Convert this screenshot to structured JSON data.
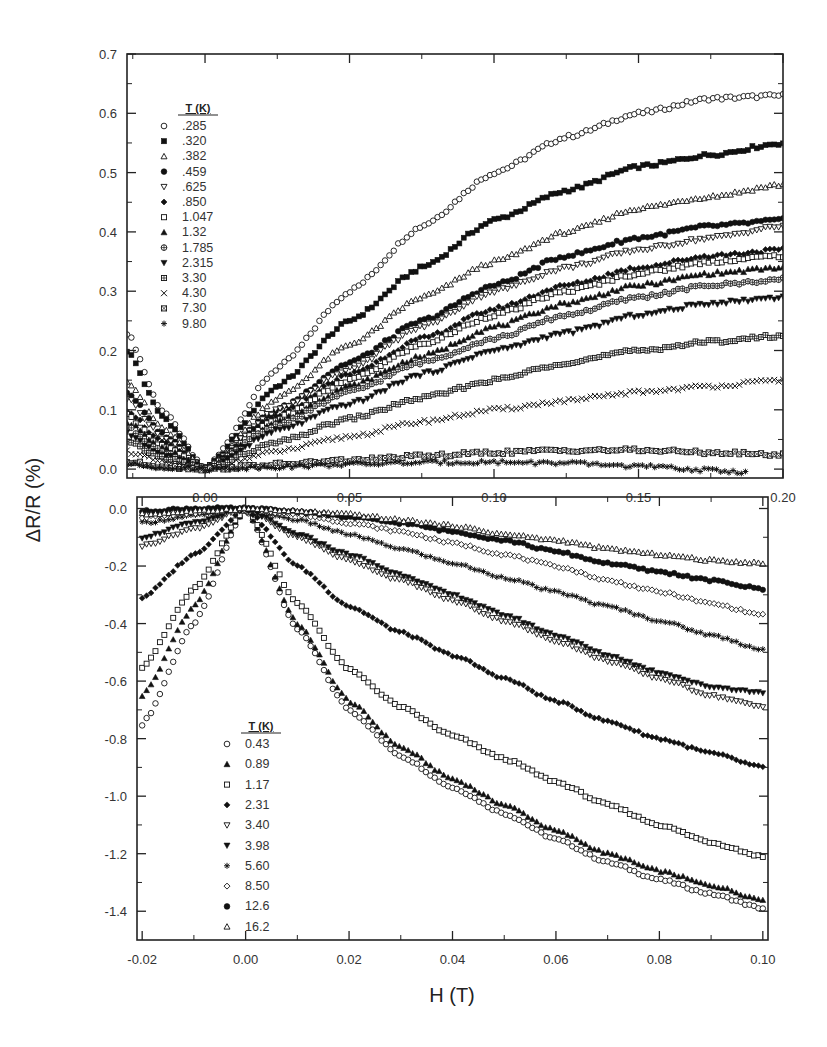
{
  "figure": {
    "ylabel": "ΔR/R (%)",
    "xlabel": "H (T)"
  },
  "chart_data": [
    {
      "type": "scatter",
      "panel": "top",
      "title": "",
      "xlabel": "",
      "ylabel": "ΔR/R (%)",
      "xlim": [
        -0.027,
        0.2
      ],
      "ylim": [
        -0.015,
        0.7
      ],
      "x_ticks": [
        "0.00",
        "0.05",
        "0.10",
        "0.15",
        "0.20"
      ],
      "y_ticks": [
        "0.0",
        "0.1",
        "0.2",
        "0.3",
        "0.4",
        "0.5",
        "0.6",
        "0.7"
      ],
      "grid": false,
      "legend_title": "T (K)",
      "legend_position": "upper-left",
      "series": [
        {
          "name": ".285",
          "marker": "open-circle",
          "x": [
            -0.027,
            -0.015,
            0,
            0.025,
            0.05,
            0.075,
            0.1,
            0.125,
            0.15,
            0.175,
            0.2
          ],
          "values": [
            0.23,
            0.1,
            0.0,
            0.17,
            0.3,
            0.41,
            0.5,
            0.56,
            0.6,
            0.625,
            0.63
          ]
        },
        {
          "name": ".320",
          "marker": "filled-square",
          "x": [
            -0.027,
            -0.015,
            0,
            0.025,
            0.05,
            0.075,
            0.1,
            0.125,
            0.15,
            0.175,
            0.2
          ],
          "values": [
            0.2,
            0.09,
            0.0,
            0.14,
            0.25,
            0.34,
            0.42,
            0.47,
            0.51,
            0.53,
            0.55
          ]
        },
        {
          "name": ".382",
          "marker": "open-triangle-up",
          "x": [
            -0.027,
            -0.015,
            0,
            0.025,
            0.05,
            0.075,
            0.1,
            0.125,
            0.15,
            0.175,
            0.2
          ],
          "values": [
            0.15,
            0.07,
            0.0,
            0.12,
            0.21,
            0.29,
            0.35,
            0.4,
            0.44,
            0.46,
            0.48
          ]
        },
        {
          "name": ".459",
          "marker": "filled-circle",
          "x": [
            -0.027,
            -0.015,
            0,
            0.025,
            0.05,
            0.075,
            0.1,
            0.125,
            0.15,
            0.175,
            0.2
          ],
          "values": [
            0.13,
            0.06,
            0.0,
            0.1,
            0.18,
            0.25,
            0.31,
            0.36,
            0.39,
            0.41,
            0.42
          ]
        },
        {
          "name": ".625",
          "marker": "open-triangle-down",
          "x": [
            -0.027,
            -0.015,
            0,
            0.025,
            0.05,
            0.075,
            0.1,
            0.125,
            0.15,
            0.175,
            0.2
          ],
          "values": [
            0.12,
            0.055,
            0.0,
            0.1,
            0.17,
            0.24,
            0.3,
            0.34,
            0.37,
            0.39,
            0.41
          ]
        },
        {
          "name": ".850",
          "marker": "filled-diamond",
          "x": [
            -0.027,
            -0.015,
            0,
            0.025,
            0.05,
            0.075,
            0.1,
            0.125,
            0.15,
            0.175,
            0.2
          ],
          "values": [
            0.1,
            0.045,
            0.0,
            0.09,
            0.16,
            0.22,
            0.27,
            0.31,
            0.34,
            0.36,
            0.37
          ]
        },
        {
          "name": "1.047",
          "marker": "open-square",
          "x": [
            -0.027,
            -0.015,
            0,
            0.025,
            0.05,
            0.075,
            0.1,
            0.125,
            0.15,
            0.175,
            0.2
          ],
          "values": [
            0.09,
            0.04,
            0.0,
            0.085,
            0.15,
            0.21,
            0.26,
            0.3,
            0.33,
            0.35,
            0.36
          ]
        },
        {
          "name": "1.32",
          "marker": "filled-triangle-up",
          "x": [
            -0.027,
            -0.015,
            0,
            0.025,
            0.05,
            0.075,
            0.1,
            0.125,
            0.15,
            0.175,
            0.2
          ],
          "values": [
            0.08,
            0.035,
            0.0,
            0.08,
            0.14,
            0.19,
            0.24,
            0.28,
            0.31,
            0.33,
            0.34
          ]
        },
        {
          "name": "1.785",
          "marker": "crossed-circle",
          "x": [
            -0.027,
            -0.015,
            0,
            0.025,
            0.05,
            0.075,
            0.1,
            0.125,
            0.15,
            0.175,
            0.2
          ],
          "values": [
            0.07,
            0.03,
            0.0,
            0.075,
            0.13,
            0.18,
            0.22,
            0.26,
            0.29,
            0.31,
            0.32
          ]
        },
        {
          "name": "2.315",
          "marker": "filled-triangle-down",
          "x": [
            -0.027,
            -0.015,
            0,
            0.025,
            0.05,
            0.075,
            0.1,
            0.125,
            0.15,
            0.175,
            0.2
          ],
          "values": [
            0.06,
            0.025,
            0.0,
            0.065,
            0.11,
            0.16,
            0.2,
            0.23,
            0.26,
            0.28,
            0.29
          ]
        },
        {
          "name": "3.30",
          "marker": "boxed-plus",
          "x": [
            -0.027,
            -0.015,
            0,
            0.025,
            0.05,
            0.075,
            0.1,
            0.125,
            0.15,
            0.175,
            0.2
          ],
          "values": [
            0.045,
            0.02,
            0.0,
            0.045,
            0.085,
            0.12,
            0.15,
            0.18,
            0.2,
            0.215,
            0.225
          ]
        },
        {
          "name": "4.30",
          "marker": "cross",
          "x": [
            -0.027,
            -0.015,
            0,
            0.025,
            0.05,
            0.075,
            0.1,
            0.125,
            0.15,
            0.175,
            0.2
          ],
          "values": [
            0.03,
            0.012,
            0.0,
            0.03,
            0.055,
            0.08,
            0.1,
            0.115,
            0.13,
            0.14,
            0.15
          ]
        },
        {
          "name": "7.30",
          "marker": "boxed-x",
          "x": [
            -0.027,
            -0.015,
            0,
            0.025,
            0.05,
            0.075,
            0.1,
            0.125,
            0.15,
            0.175,
            0.2
          ],
          "values": [
            0.012,
            0.005,
            0.0,
            0.008,
            0.015,
            0.022,
            0.028,
            0.032,
            0.032,
            0.028,
            0.024
          ]
        },
        {
          "name": "9.80",
          "marker": "asterisk",
          "x": [
            -0.027,
            -0.015,
            0,
            0.025,
            0.05,
            0.075,
            0.1,
            0.125,
            0.15,
            0.175,
            0.187
          ],
          "values": [
            0.008,
            0.003,
            0.0,
            0.004,
            0.008,
            0.011,
            0.012,
            0.01,
            0.005,
            -0.002,
            -0.005
          ]
        }
      ]
    },
    {
      "type": "scatter",
      "panel": "bottom",
      "title": "",
      "xlabel": "H (T)",
      "ylabel": "ΔR/R (%)",
      "xlim": [
        -0.021,
        0.101
      ],
      "ylim": [
        -1.5,
        0.04
      ],
      "x_ticks": [
        "-0.02",
        "0.00",
        "0.02",
        "0.04",
        "0.06",
        "0.08",
        "0.10"
      ],
      "y_ticks": [
        "0.0",
        "-0.2",
        "-0.4",
        "-0.6",
        "-0.8",
        "-1.0",
        "-1.2",
        "-1.4"
      ],
      "grid": false,
      "legend_title": "T (K)",
      "legend_position": "lower-left",
      "series": [
        {
          "name": "0.43",
          "marker": "open-circle",
          "x": [
            -0.02,
            -0.01,
            0,
            0.01,
            0.02,
            0.03,
            0.04,
            0.05,
            0.06,
            0.07,
            0.08,
            0.09,
            0.1
          ],
          "values": [
            -0.75,
            -0.4,
            0.0,
            -0.42,
            -0.7,
            -0.86,
            -0.97,
            -1.06,
            -1.15,
            -1.23,
            -1.29,
            -1.34,
            -1.39
          ]
        },
        {
          "name": "0.89",
          "marker": "filled-triangle-up",
          "x": [
            -0.02,
            -0.01,
            0,
            0.01,
            0.02,
            0.03,
            0.04,
            0.05,
            0.06,
            0.07,
            0.08,
            0.09,
            0.1
          ],
          "values": [
            -0.65,
            -0.34,
            0.0,
            -0.4,
            -0.67,
            -0.83,
            -0.94,
            -1.03,
            -1.12,
            -1.2,
            -1.26,
            -1.31,
            -1.36
          ]
        },
        {
          "name": "1.17",
          "marker": "open-square",
          "x": [
            -0.02,
            -0.01,
            0,
            0.01,
            0.02,
            0.03,
            0.04,
            0.05,
            0.06,
            0.07,
            0.08,
            0.09,
            0.1
          ],
          "values": [
            -0.55,
            -0.28,
            0.0,
            -0.33,
            -0.56,
            -0.69,
            -0.79,
            -0.87,
            -0.95,
            -1.03,
            -1.1,
            -1.16,
            -1.21
          ]
        },
        {
          "name": "2.31",
          "marker": "filled-diamond",
          "x": [
            -0.02,
            -0.01,
            0,
            0.01,
            0.02,
            0.03,
            0.04,
            0.05,
            0.06,
            0.07,
            0.08,
            0.09,
            0.1
          ],
          "values": [
            -0.31,
            -0.16,
            0.0,
            -0.2,
            -0.34,
            -0.43,
            -0.51,
            -0.59,
            -0.67,
            -0.74,
            -0.8,
            -0.85,
            -0.9
          ]
        },
        {
          "name": "3.40",
          "marker": "open-triangle-down",
          "x": [
            -0.02,
            -0.01,
            0,
            0.01,
            0.02,
            0.03,
            0.04,
            0.05,
            0.06,
            0.07,
            0.08,
            0.09,
            0.1
          ],
          "values": [
            -0.13,
            -0.07,
            0.0,
            -0.1,
            -0.18,
            -0.25,
            -0.32,
            -0.39,
            -0.46,
            -0.53,
            -0.59,
            -0.65,
            -0.69
          ]
        },
        {
          "name": "3.98",
          "marker": "filled-triangle-down",
          "x": [
            -0.02,
            -0.01,
            0,
            0.01,
            0.02,
            0.03,
            0.04,
            0.05,
            0.06,
            0.07,
            0.08,
            0.09,
            0.1
          ],
          "values": [
            -0.1,
            -0.05,
            0.0,
            -0.09,
            -0.16,
            -0.23,
            -0.3,
            -0.37,
            -0.44,
            -0.51,
            -0.57,
            -0.62,
            -0.64
          ]
        },
        {
          "name": "5.60",
          "marker": "asterisk",
          "x": [
            -0.02,
            -0.01,
            0,
            0.01,
            0.02,
            0.03,
            0.04,
            0.05,
            0.06,
            0.07,
            0.08,
            0.09,
            0.1
          ],
          "values": [
            -0.05,
            -0.025,
            0.0,
            -0.04,
            -0.09,
            -0.14,
            -0.19,
            -0.24,
            -0.29,
            -0.34,
            -0.39,
            -0.44,
            -0.49
          ]
        },
        {
          "name": "8.50",
          "marker": "open-diamond",
          "x": [
            -0.02,
            -0.01,
            0,
            0.01,
            0.02,
            0.03,
            0.04,
            0.05,
            0.06,
            0.07,
            0.08,
            0.09,
            0.1
          ],
          "values": [
            -0.03,
            -0.015,
            0.0,
            -0.02,
            -0.05,
            -0.08,
            -0.12,
            -0.16,
            -0.2,
            -0.25,
            -0.29,
            -0.33,
            -0.37
          ]
        },
        {
          "name": "12.6",
          "marker": "filled-circle",
          "x": [
            -0.02,
            -0.01,
            0,
            0.01,
            0.02,
            0.03,
            0.04,
            0.05,
            0.06,
            0.07,
            0.08,
            0.09,
            0.1
          ],
          "values": [
            -0.01,
            0.0,
            0.0,
            -0.01,
            -0.03,
            -0.05,
            -0.08,
            -0.11,
            -0.15,
            -0.19,
            -0.22,
            -0.25,
            -0.28
          ]
        },
        {
          "name": "16.2",
          "marker": "open-triangle-up",
          "x": [
            -0.02,
            -0.01,
            0,
            0.01,
            0.02,
            0.03,
            0.04,
            0.05,
            0.06,
            0.07,
            0.08,
            0.09,
            0.1
          ],
          "values": [
            -0.02,
            -0.01,
            0.0,
            -0.01,
            -0.02,
            -0.04,
            -0.06,
            -0.09,
            -0.11,
            -0.14,
            -0.16,
            -0.18,
            -0.19
          ]
        }
      ]
    }
  ]
}
